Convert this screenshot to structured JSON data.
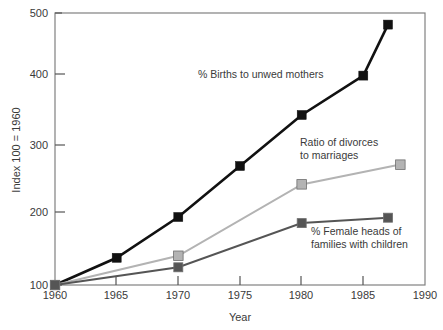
{
  "chart_data": {
    "type": "line",
    "title": "",
    "xlabel": "Year",
    "ylabel": "Index 100 = 1960",
    "xlim": [
      1960,
      1990
    ],
    "ylim": [
      100,
      500
    ],
    "xticks": [
      1960,
      1965,
      1970,
      1975,
      1980,
      1985,
      1990
    ],
    "xtick_labels": [
      "1960",
      "1965",
      "1970",
      "1975",
      "1980",
      "1985",
      "1990"
    ],
    "yticks": [
      100,
      200,
      300,
      400,
      500
    ],
    "ytick_labels": [
      "100",
      "200",
      "300",
      "400",
      "500"
    ],
    "grid": false,
    "legend": "inline-annotations",
    "series": [
      {
        "name": "% Births to unwed mothers",
        "color": "#111111",
        "marker": "square",
        "x": [
          1960,
          1965,
          1970,
          1975,
          1980,
          1985,
          1987
        ],
        "values": [
          100,
          140,
          200,
          275,
          350,
          408,
          483
        ]
      },
      {
        "name": "Ratio of divorces to marriages",
        "color": "#b3b3b3",
        "marker": "square",
        "x": [
          1960,
          1970,
          1980,
          1988
        ],
        "values": [
          100,
          143,
          248,
          277
        ]
      },
      {
        "name": "% Female heads of families with children",
        "color": "#555555",
        "marker": "square",
        "x": [
          1960,
          1970,
          1980,
          1987
        ],
        "values": [
          100,
          126,
          191,
          199
        ]
      }
    ],
    "annotations": [
      {
        "id": "unwed-mothers",
        "lines": [
          "% Births to unwed mothers"
        ],
        "x_px": 198,
        "y_px": 78,
        "anchor": "start"
      },
      {
        "id": "divorces-marriages",
        "lines": [
          "Ratio of divorces",
          "to marriages"
        ],
        "x_px": 300,
        "y_px": 146,
        "anchor": "start"
      },
      {
        "id": "female-heads",
        "lines": [
          "% Female heads of",
          "families with children"
        ],
        "x_px": 311,
        "y_px": 235,
        "anchor": "start"
      }
    ]
  },
  "axes": {
    "x_title": "Year",
    "y_title": "Index 100 = 1960",
    "x_labels": [
      "1960",
      "1965",
      "1970",
      "1975",
      "1980",
      "1985",
      "1990"
    ],
    "y_labels": [
      "100",
      "200",
      "300",
      "400",
      "500"
    ]
  },
  "colors": {
    "frame": "#808080",
    "series_black": "#111111",
    "series_light_gray": "#b3b3b3",
    "series_dark_gray": "#555555",
    "text": "#3a3a3a",
    "background": "#ffffff"
  }
}
